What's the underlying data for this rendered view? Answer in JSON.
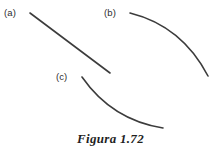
{
  "figure": {
    "caption": "Figura 1.72",
    "width": 221,
    "height": 153,
    "background_color": "#ffffff",
    "stroke_color": "#3c3c3c",
    "label_color": "#2e2e2e",
    "caption_color": "#1f1f1f"
  },
  "chart_data": {
    "type": "line",
    "title": "Figura 1.72",
    "xlabel": "",
    "ylabel": "",
    "grid": false,
    "legend_position": "none",
    "annotations": [
      "(a)",
      "(b)",
      "(c)"
    ],
    "series": [
      {
        "name": "(a)",
        "label": "(a)",
        "shape": "near-straight decreasing segment, very slight concave-up",
        "path": "M 30 13 Q 70 43 110 73",
        "start": [
          30,
          13
        ],
        "end": [
          110,
          73
        ]
      },
      {
        "name": "(b)",
        "label": "(b)",
        "shape": "decreasing concave-down arc, steepening to the right",
        "path": "M 130 13 Q 182 26 208 76",
        "start": [
          130,
          13
        ],
        "end": [
          208,
          76
        ]
      },
      {
        "name": "(c)",
        "label": "(c)",
        "shape": "decreasing concave-up arc, flattening to the right",
        "path": "M 82 77 Q 112 120 163 128",
        "start": [
          82,
          77
        ],
        "end": [
          163,
          128
        ]
      }
    ]
  },
  "labels": {
    "a": "(a)",
    "b": "(b)",
    "c": "(c)"
  }
}
